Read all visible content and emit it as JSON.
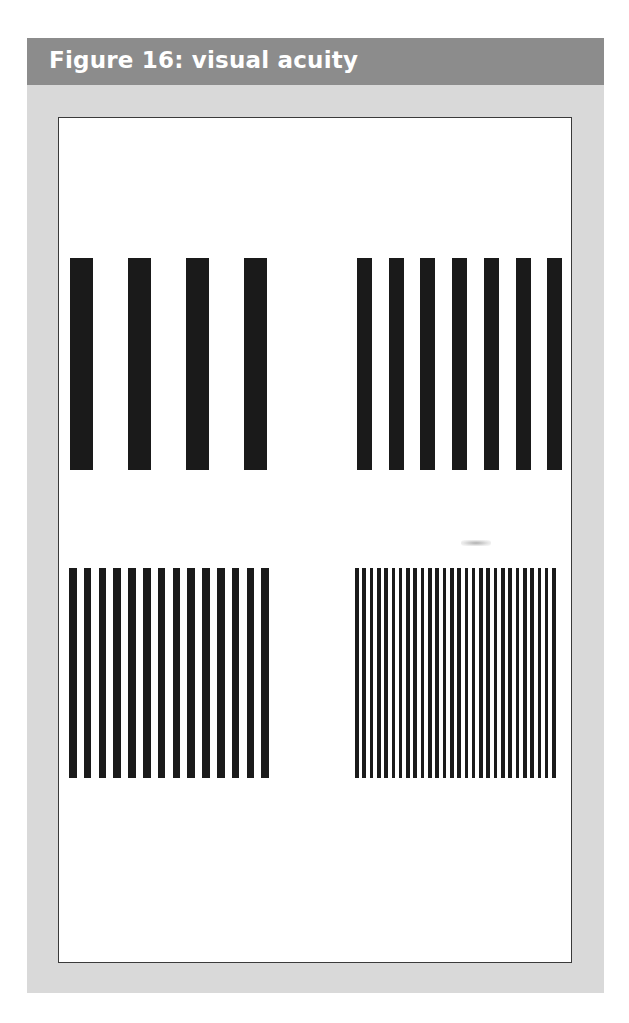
{
  "figure": {
    "title": "Figure 16: visual acuity",
    "colors": {
      "header_bg": "#8c8c8c",
      "header_text": "#ffffff",
      "panel_bg": "#d9d9d9",
      "figure_bg": "#ffffff",
      "bar_color": "#1a1a1a"
    },
    "gratings": [
      {
        "name": "coarse-grating",
        "position": "top-left",
        "bar_count": 4,
        "bar_width": 23,
        "pitch": 58,
        "left": 70,
        "top": 258,
        "height": 212
      },
      {
        "name": "medium-grating",
        "position": "top-right",
        "bar_count": 7,
        "bar_width": 15,
        "pitch": 31.7,
        "left": 357,
        "top": 258,
        "height": 212
      },
      {
        "name": "fine-grating",
        "position": "bottom-left",
        "bar_count": 14,
        "bar_width": 7.5,
        "pitch": 14.8,
        "left": 69,
        "top": 568,
        "height": 210
      },
      {
        "name": "very-fine-grating",
        "position": "bottom-right",
        "bar_count": 28,
        "bar_width": 3.7,
        "pitch": 7.3,
        "left": 355,
        "top": 568,
        "height": 210
      }
    ]
  }
}
